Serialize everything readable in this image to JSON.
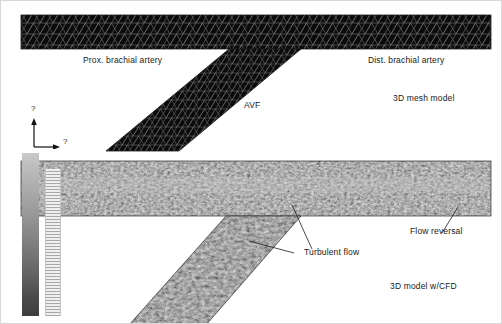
{
  "figure": {
    "background_color": "#ffffff",
    "width": 502,
    "height": 324
  },
  "panels": [
    {
      "id": "mesh-panel",
      "caption": "3D mesh model",
      "description": "Triangulated surface mesh of the brachial artery with an arteriovenous fistula branching downward-left",
      "mesh_color": "#0d0d0d",
      "wireframe_color": "#8a8a8a"
    },
    {
      "id": "cfd-panel",
      "caption": "3D model w/CFD",
      "description": "Same geometry rendered with computational fluid dynamics velocity field showing mottled turbulent structures",
      "flow_color_light": "#c9c9c9",
      "flow_color_dark": "#1a1a1a"
    }
  ],
  "labels": {
    "prox_brachial_artery": "Prox. brachial artery",
    "dist_brachial_artery": "Dist. brachial artery",
    "avf": "AVF",
    "mesh_model_caption": "3D mesh model",
    "cfd_model_caption": "3D model w/CFD",
    "turbulent_flow": "Turbulent flow",
    "flow_reversal": "Flow reversal"
  },
  "axis_indicator": {
    "y_axis_label": "?",
    "x_axis_label": "?",
    "note": "Axis labels render as missing-glyph question marks in the source image"
  },
  "colorbar": {
    "orientation": "vertical",
    "top_color": "#c9c9c9",
    "bottom_color": "#3d3d3d",
    "tick_strip": "ladder of repeating horizontal tick marks"
  }
}
